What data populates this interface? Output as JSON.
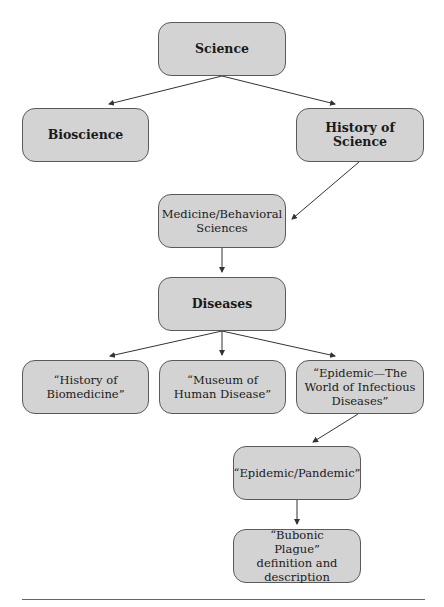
{
  "diagram": {
    "type": "hierarchy-flowchart",
    "nodes": [
      {
        "id": "science",
        "label": "Science",
        "bold": true
      },
      {
        "id": "bioscience",
        "label": "Bioscience",
        "bold": true
      },
      {
        "id": "history_of_science",
        "label": "History of Science",
        "bold": true
      },
      {
        "id": "medicine",
        "label": "Medicine/Behavioral Sciences",
        "bold": false
      },
      {
        "id": "diseases",
        "label": "Diseases",
        "bold": true
      },
      {
        "id": "history_biomedicine",
        "label": "“History of Biomedicine”",
        "bold": false
      },
      {
        "id": "museum",
        "label": "“Museum of Human Disease”",
        "bold": false
      },
      {
        "id": "epidemic_world",
        "label": "“Epidemic—The World of Infectious Diseases”",
        "bold": false
      },
      {
        "id": "epidemic_pandemic",
        "label": "“Epidemic/Pandemic”",
        "bold": false
      },
      {
        "id": "bubonic",
        "label": "“Bubonic Plague” definition and description",
        "bold": false
      }
    ],
    "edges": [
      {
        "from": "science",
        "to": "bioscience"
      },
      {
        "from": "science",
        "to": "history_of_science"
      },
      {
        "from": "history_of_science",
        "to": "medicine"
      },
      {
        "from": "medicine",
        "to": "diseases"
      },
      {
        "from": "diseases",
        "to": "history_biomedicine"
      },
      {
        "from": "diseases",
        "to": "museum"
      },
      {
        "from": "diseases",
        "to": "epidemic_world"
      },
      {
        "from": "epidemic_world",
        "to": "epidemic_pandemic"
      },
      {
        "from": "epidemic_pandemic",
        "to": "bubonic"
      }
    ],
    "colors": {
      "node_fill": "#d3d3d3",
      "node_border": "#5a5a5a",
      "arrow": "#333333"
    }
  }
}
